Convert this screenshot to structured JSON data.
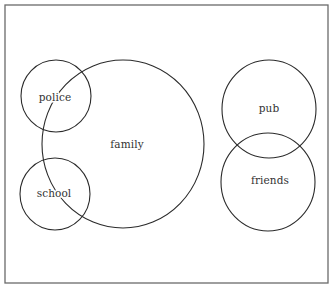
{
  "diagram": {
    "type": "overlapping-circles",
    "frame": {
      "x": 5,
      "y": 5,
      "width": 323,
      "height": 278,
      "stroke": "#6a6a6a"
    },
    "stroke_color": "#2b2b2b",
    "text_color": "#333333",
    "nodes": [
      {
        "id": "family",
        "label": "family",
        "cx": 123,
        "cy": 144,
        "rx": 81,
        "ry": 84,
        "label_x": 127,
        "label_y": 145
      },
      {
        "id": "police",
        "label": "police",
        "cx": 56,
        "cy": 96,
        "rx": 35,
        "ry": 36,
        "label_x": 55,
        "label_y": 98
      },
      {
        "id": "school",
        "label": "school",
        "cx": 55,
        "cy": 194,
        "rx": 35,
        "ry": 36,
        "label_x": 54,
        "label_y": 194
      },
      {
        "id": "pub",
        "label": "pub",
        "cx": 269,
        "cy": 109,
        "rx": 47,
        "ry": 49,
        "label_x": 269,
        "label_y": 109
      },
      {
        "id": "friends",
        "label": "friends",
        "cx": 268,
        "cy": 182,
        "rx": 47,
        "ry": 49,
        "label_x": 270,
        "label_y": 181
      }
    ],
    "overlaps": [
      [
        "police",
        "family"
      ],
      [
        "school",
        "family"
      ],
      [
        "pub",
        "friends"
      ]
    ]
  }
}
